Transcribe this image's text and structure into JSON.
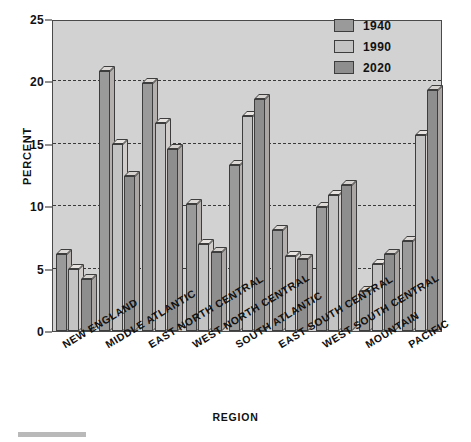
{
  "chart_data": {
    "type": "bar",
    "title": "",
    "xlabel": "REGION",
    "ylabel": "PERCENT",
    "ylim": [
      0,
      25
    ],
    "yticks": [
      0,
      5,
      10,
      15,
      20,
      25
    ],
    "grid": true,
    "legend_position": "top-right",
    "categories": [
      "NEW ENGLAND",
      "MIDDLE ATLANTIC",
      "EAST NORTH CENTRAL",
      "WEST NORTH CENTRAL",
      "SOUTH ATLANTIC",
      "EAST SOUTH CENTRAL",
      "WEST SOUTH CENTRAL",
      "MOUNTAIN",
      "PACIFIC"
    ],
    "series": [
      {
        "name": "1940",
        "values": [
          6.2,
          20.8,
          19.9,
          10.2,
          13.3,
          8.1,
          9.9,
          3.2,
          7.2
        ]
      },
      {
        "name": "1990",
        "values": [
          5.0,
          15.0,
          16.7,
          7.0,
          17.2,
          6.0,
          10.9,
          5.4,
          15.7
        ]
      },
      {
        "name": "2020",
        "values": [
          4.2,
          12.4,
          14.6,
          6.3,
          18.6,
          5.8,
          11.7,
          6.2,
          19.3
        ]
      }
    ],
    "colors": {
      "series_1940": "#9a9a9a",
      "series_1990": "#c3c3c3",
      "series_2020": "#8e8e8e",
      "plot_background": "#d2d2d2",
      "gridline": "#3a3a3a",
      "axis": "#333333"
    }
  },
  "legend": {
    "items": [
      {
        "label": "1940",
        "swatch": "#9a9a9a"
      },
      {
        "label": "1990",
        "swatch": "#c3c3c3"
      },
      {
        "label": "2020",
        "swatch": "#8e8e8e"
      }
    ]
  },
  "axes": {
    "y_title": "PERCENT",
    "x_title": "REGION",
    "y_tick_labels": [
      "0",
      "5",
      "10",
      "15",
      "20",
      "25"
    ]
  }
}
